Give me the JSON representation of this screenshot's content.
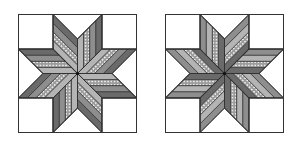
{
  "figure": {
    "colors": {
      "background": "#ffffff",
      "outline": "#333333",
      "dark": "#6a6a6a",
      "medium": "#8e8e8e",
      "light": "#b4b4b4",
      "dotted_base": "#9c9c9c",
      "dot": "#ffffff"
    },
    "blocks": [
      {
        "name": "left-star-block",
        "x": 18,
        "y": 14,
        "size": 118,
        "strip_order": [
          "light",
          "dotted",
          "medium",
          "dark"
        ],
        "direction": "ccw"
      },
      {
        "name": "right-star-block",
        "x": 165,
        "y": 14,
        "size": 118,
        "strip_order": [
          "dark",
          "dotted",
          "light",
          "medium"
        ],
        "direction": "cw"
      }
    ]
  }
}
